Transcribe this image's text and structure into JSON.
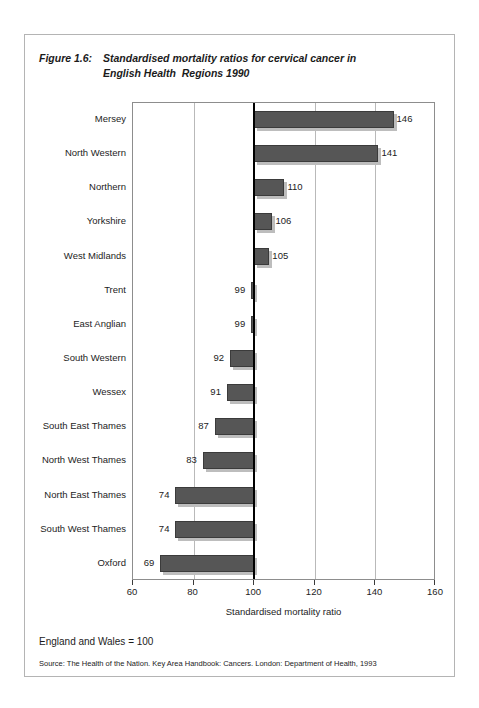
{
  "figure": {
    "number_label": "Figure 1.6:",
    "title_line1": "Standardised mortality ratios for cervical cancer in",
    "title_line2": "English Health  Regions 1990",
    "note": "England and Wales = 100",
    "source": "Source: The Health of the Nation. Key Area Handbook: Cancers. London: Department of Health, 1993"
  },
  "chart_data": {
    "type": "bar",
    "orientation": "horizontal",
    "title": "Standardised mortality ratios for cervical cancer in English Health  Regions 1990",
    "xlabel": "Standardised mortality ratio",
    "ylabel": "",
    "xlim": [
      60,
      160
    ],
    "xticks": [
      60,
      80,
      100,
      120,
      140,
      160
    ],
    "xtick_labels": [
      "60",
      "80",
      "100",
      "120",
      "140",
      "160"
    ],
    "grid": true,
    "reference_line": 100,
    "reference_line_label": "England and Wales = 100",
    "legend": null,
    "bar_color": "#565656",
    "shadow_color": "#bdbdbd",
    "gridline_color": "#b9b9b9",
    "categories": [
      "Mersey",
      "North Western",
      "Northern",
      "Yorkshire",
      "West Midlands",
      "Trent",
      "East Anglian",
      "South Western",
      "Wessex",
      "South East Thames",
      "North West Thames",
      "North East Thames",
      "South West Thames",
      "Oxford"
    ],
    "values": [
      146,
      141,
      110,
      106,
      105,
      99,
      99,
      92,
      91,
      87,
      83,
      74,
      74,
      69
    ],
    "data_labels": [
      "146",
      "141",
      "110",
      "106",
      "105",
      "99",
      "99",
      "92",
      "91",
      "87",
      "83",
      "74",
      "74",
      "69"
    ]
  }
}
